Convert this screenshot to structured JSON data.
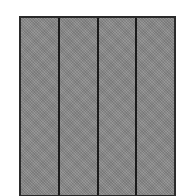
{
  "figure": {
    "shape": "rectangle",
    "panel_count": 4,
    "fill_color": "#8a8a8a",
    "border_color": "#2a2a2a",
    "divider_color": "#1a1a1a",
    "panels": [
      {
        "index": 1
      },
      {
        "index": 2
      },
      {
        "index": 3
      },
      {
        "index": 4
      }
    ]
  }
}
